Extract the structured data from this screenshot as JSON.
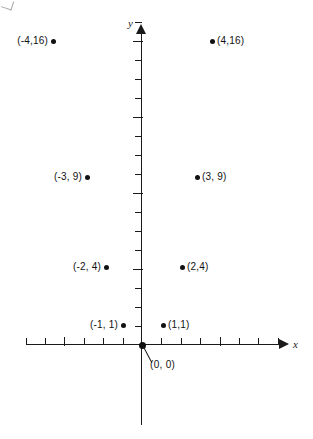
{
  "figure": {
    "background_color": "#ffffff",
    "ink_color": "#111111"
  },
  "axes": {
    "x_label": "x",
    "y_label": "y",
    "origin_label": "(0, 0)",
    "x_tick_count_left": 6,
    "x_tick_count_right": 7,
    "y_tick_count_up": 17,
    "x_range": [
      -6,
      7
    ],
    "y_range": [
      -4,
      17
    ],
    "grid": false
  },
  "chart_data": {
    "type": "scatter",
    "title": "",
    "subtitle": "",
    "xlabel": "x",
    "ylabel": "y",
    "xlim": [
      -6,
      7
    ],
    "ylim": [
      -4,
      17
    ],
    "grid": false,
    "legend": "none",
    "relation": "y = x squared",
    "x": [
      -4,
      -3,
      -2,
      -1,
      0,
      1,
      2,
      3,
      4
    ],
    "y": [
      16,
      9,
      4,
      1,
      0,
      1,
      4,
      9,
      16
    ],
    "points": [
      {
        "x": -4,
        "y": 16,
        "label": "(-4,16)",
        "label_side": "left",
        "px": 53,
        "py": 41
      },
      {
        "x": -3,
        "y": 9,
        "label": "(-3, 9)",
        "label_side": "left",
        "px": 87,
        "py": 177
      },
      {
        "x": -2,
        "y": 4,
        "label": "(-2, 4)",
        "label_side": "left",
        "px": 106,
        "py": 267
      },
      {
        "x": -1,
        "y": 1,
        "label": "(-1, 1)",
        "label_side": "left",
        "px": 123,
        "py": 325
      },
      {
        "x": 0,
        "y": 0,
        "label": "(0, 0)",
        "label_side": "leader",
        "px": 142,
        "py": 345
      },
      {
        "x": 1,
        "y": 1,
        "label": "(1,1)",
        "label_side": "right",
        "px": 163,
        "py": 325
      },
      {
        "x": 2,
        "y": 4,
        "label": "(2,4)",
        "label_side": "right",
        "px": 182,
        "py": 267
      },
      {
        "x": 3,
        "y": 9,
        "label": "(3, 9)",
        "label_side": "right",
        "px": 197,
        "py": 177
      },
      {
        "x": 4,
        "y": 16,
        "label": "(4,16)",
        "label_side": "right",
        "px": 212,
        "py": 41
      }
    ]
  }
}
